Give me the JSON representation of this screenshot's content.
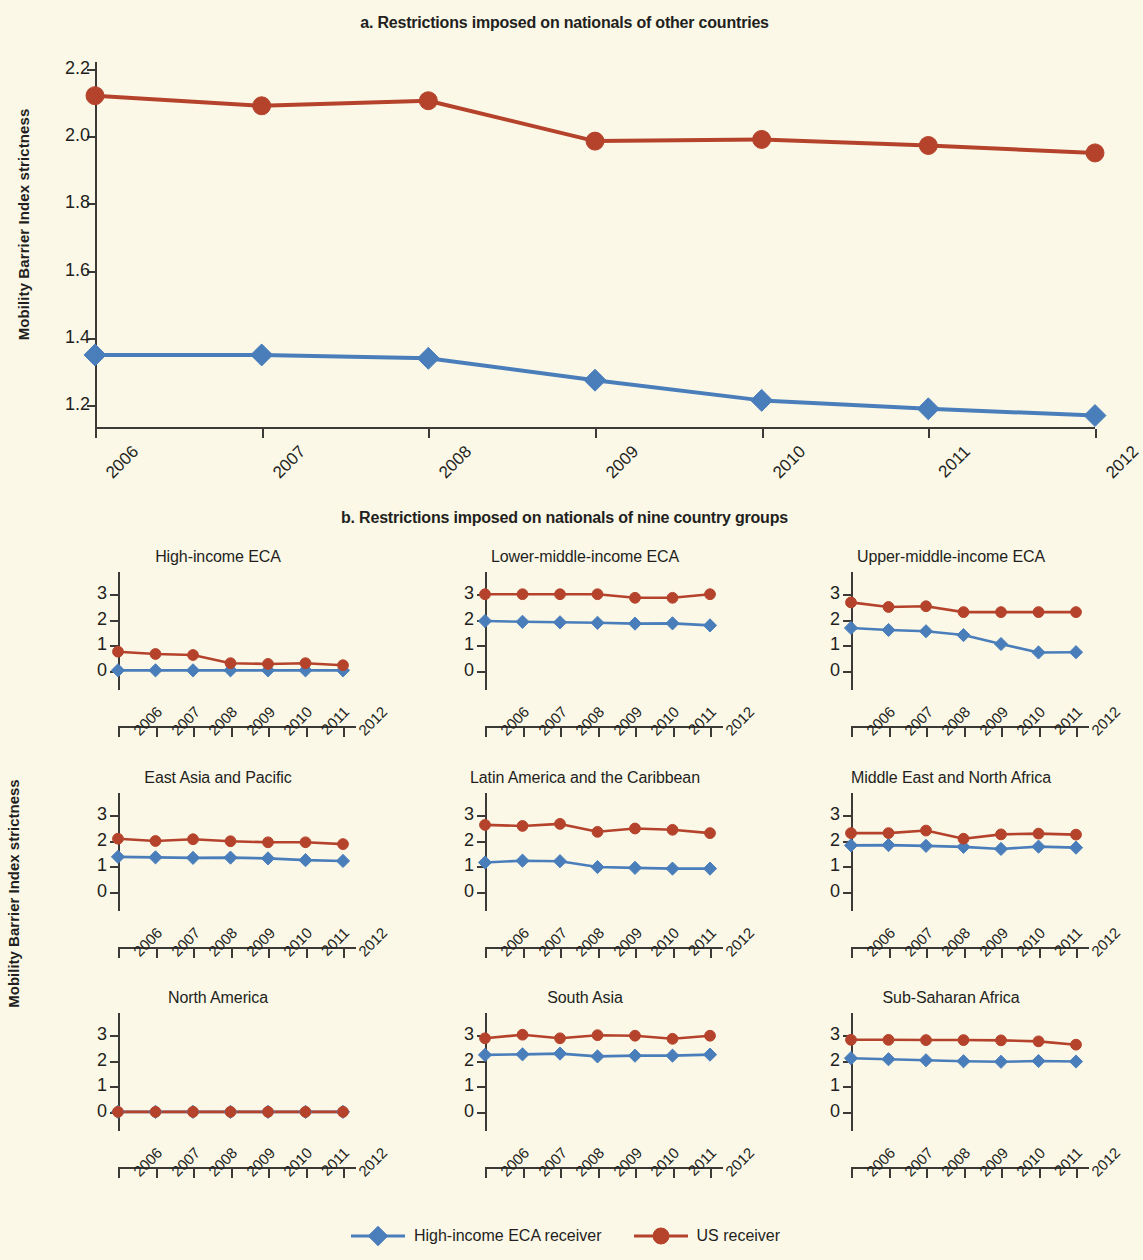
{
  "figure": {
    "y_axis_label": "Mobility Barrier Index strictness",
    "colors": {
      "blue": "#4a7ebb",
      "red": "#b5432c",
      "background": "#fbf8e8",
      "axis": "#3b3a36"
    },
    "legend": [
      {
        "label": "High-income ECA receiver",
        "marker": "diamond",
        "color": "#4a7ebb"
      },
      {
        "label": "US receiver",
        "marker": "circle",
        "color": "#b5432c"
      }
    ]
  },
  "chart_data": [
    {
      "type": "line",
      "panel": "a",
      "title": "a. Restrictions imposed on nationals of other countries",
      "xlabel": "",
      "ylabel": "Mobility Barrier Index strictness",
      "x": [
        2006,
        2007,
        2008,
        2009,
        2010,
        2011,
        2012
      ],
      "xticklabels": [
        "2006",
        "2007",
        "2008",
        "2009",
        "2010",
        "2011",
        "2012"
      ],
      "ylim": [
        1.13,
        2.22
      ],
      "yticks": [
        1.2,
        1.4,
        1.6,
        1.8,
        2.0,
        2.2
      ],
      "yticklabels": [
        "1.2",
        "1.4",
        "1.6",
        "1.8",
        "2.0",
        "2.2"
      ],
      "grid": false,
      "legend_position": "bottom",
      "series": [
        {
          "name": "High-income ECA receiver",
          "color": "#4a7ebb",
          "marker": "diamond",
          "values": [
            1.35,
            1.35,
            1.34,
            1.275,
            1.215,
            1.19,
            1.17
          ]
        },
        {
          "name": "US receiver",
          "color": "#b5432c",
          "marker": "circle",
          "values": [
            2.12,
            2.09,
            2.105,
            1.985,
            1.99,
            1.972,
            1.95
          ]
        }
      ]
    },
    {
      "type": "line",
      "panel": "b",
      "title": "b. Restrictions imposed on nationals of nine country groups",
      "ylabel": "Mobility Barrier Index strictness",
      "x": [
        2006,
        2007,
        2008,
        2009,
        2010,
        2011,
        2012
      ],
      "xticklabels": [
        "2006",
        "2007",
        "2008",
        "2009",
        "2010",
        "2011",
        "2012"
      ],
      "ylim": [
        -0.75,
        3.4
      ],
      "yticks": [
        0,
        1,
        2,
        3
      ],
      "yticklabels": [
        "0",
        "1",
        "2",
        "3"
      ],
      "grid": false,
      "legend_position": "bottom",
      "subplots": [
        {
          "title": "High-income ECA",
          "series": [
            {
              "name": "High-income ECA receiver",
              "color": "#4a7ebb",
              "marker": "diamond",
              "values": [
                0.02,
                0.02,
                0.02,
                0.02,
                0.02,
                0.02,
                0.02
              ]
            },
            {
              "name": "US receiver",
              "color": "#b5432c",
              "marker": "circle",
              "values": [
                0.75,
                0.66,
                0.62,
                0.3,
                0.27,
                0.3,
                0.22
              ]
            }
          ]
        },
        {
          "title": "Lower-middle-income ECA",
          "series": [
            {
              "name": "High-income ECA receiver",
              "color": "#4a7ebb",
              "marker": "diamond",
              "values": [
                1.95,
                1.92,
                1.9,
                1.88,
                1.85,
                1.86,
                1.78
              ]
            },
            {
              "name": "US receiver",
              "color": "#b5432c",
              "marker": "circle",
              "values": [
                3.0,
                3.0,
                3.0,
                3.0,
                2.86,
                2.86,
                3.0
              ]
            }
          ]
        },
        {
          "title": "Upper-middle-income ECA",
          "series": [
            {
              "name": "High-income ECA receiver",
              "color": "#4a7ebb",
              "marker": "diamond",
              "values": [
                1.68,
                1.6,
                1.55,
                1.4,
                1.05,
                0.72,
                0.73
              ]
            },
            {
              "name": "US receiver",
              "color": "#b5432c",
              "marker": "circle",
              "values": [
                2.68,
                2.5,
                2.53,
                2.3,
                2.3,
                2.3,
                2.3
              ]
            }
          ]
        },
        {
          "title": "East Asia and Pacific",
          "series": [
            {
              "name": "High-income ECA receiver",
              "color": "#4a7ebb",
              "marker": "diamond",
              "values": [
                1.37,
                1.35,
                1.33,
                1.34,
                1.31,
                1.24,
                1.21
              ]
            },
            {
              "name": "US receiver",
              "color": "#b5432c",
              "marker": "circle",
              "values": [
                2.08,
                1.99,
                2.06,
                1.98,
                1.94,
                1.94,
                1.87
              ]
            }
          ]
        },
        {
          "title": "Latin America and the Caribbean",
          "series": [
            {
              "name": "High-income ECA receiver",
              "color": "#4a7ebb",
              "marker": "diamond",
              "values": [
                1.15,
                1.22,
                1.2,
                0.97,
                0.94,
                0.91,
                0.91
              ]
            },
            {
              "name": "US receiver",
              "color": "#b5432c",
              "marker": "circle",
              "values": [
                2.62,
                2.58,
                2.66,
                2.35,
                2.48,
                2.43,
                2.3
              ]
            }
          ]
        },
        {
          "title": "Middle East and North Africa",
          "series": [
            {
              "name": "High-income ECA receiver",
              "color": "#4a7ebb",
              "marker": "diamond",
              "values": [
                1.82,
                1.83,
                1.8,
                1.76,
                1.68,
                1.77,
                1.73
              ]
            },
            {
              "name": "US receiver",
              "color": "#b5432c",
              "marker": "circle",
              "values": [
                2.3,
                2.3,
                2.4,
                2.08,
                2.25,
                2.28,
                2.24
              ]
            }
          ]
        },
        {
          "title": "North America",
          "series": [
            {
              "name": "High-income ECA receiver",
              "color": "#4a7ebb",
              "marker": "diamond",
              "values": [
                0.0,
                0.0,
                0.0,
                0.0,
                0.0,
                0.0,
                0.0
              ]
            },
            {
              "name": "US receiver",
              "color": "#b5432c",
              "marker": "circle",
              "values": [
                0.0,
                0.0,
                0.0,
                0.0,
                0.0,
                0.0,
                0.0
              ]
            }
          ]
        },
        {
          "title": "South Asia",
          "series": [
            {
              "name": "High-income ECA receiver",
              "color": "#4a7ebb",
              "marker": "diamond",
              "values": [
                2.23,
                2.25,
                2.28,
                2.17,
                2.2,
                2.2,
                2.24
              ]
            },
            {
              "name": "US receiver",
              "color": "#b5432c",
              "marker": "circle",
              "values": [
                2.88,
                3.02,
                2.88,
                3.0,
                2.98,
                2.86,
                2.98
              ]
            }
          ]
        },
        {
          "title": "Sub-Saharan Africa",
          "series": [
            {
              "name": "High-income ECA receiver",
              "color": "#4a7ebb",
              "marker": "diamond",
              "values": [
                2.1,
                2.06,
                2.02,
                1.98,
                1.96,
                1.99,
                1.97
              ]
            },
            {
              "name": "US receiver",
              "color": "#b5432c",
              "marker": "circle",
              "values": [
                2.82,
                2.82,
                2.81,
                2.81,
                2.8,
                2.76,
                2.63
              ]
            }
          ]
        }
      ]
    }
  ]
}
